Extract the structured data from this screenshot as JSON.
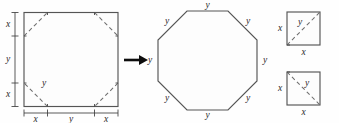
{
  "figure": {
    "colors": {
      "background": "#fefefe",
      "shape_stroke": "#555555",
      "cut_stroke": "#6d6d6d",
      "dimension_stroke": "#3d3d3d",
      "arrow": "#0d0d0d",
      "label_text": "#2b2b2b"
    },
    "square": {
      "name": "original-square",
      "left_dimension_labels": [
        "x",
        "y",
        "x"
      ],
      "bottom_dimension_labels": [
        "x",
        "y",
        "x"
      ],
      "cut_label": "y",
      "corner_cut_count": 4
    },
    "arrow": {
      "name": "transform-arrow",
      "direction": "right"
    },
    "octagon": {
      "name": "resulting-octagon",
      "side_count": 8,
      "side_labels": [
        "y",
        "y",
        "y",
        "y",
        "y",
        "y",
        "y",
        "y"
      ]
    },
    "corner_pieces": [
      {
        "name": "corner-piece-top",
        "side_label_left": "x",
        "side_label_bottom": "x",
        "diagonal_label": "y",
        "diagonal_direction": "bottom-left-to-top-right"
      },
      {
        "name": "corner-piece-bottom",
        "side_label_left": "x",
        "side_label_bottom": "x",
        "diagonal_label": "y",
        "diagonal_direction": "top-left-to-bottom-right"
      }
    ]
  }
}
